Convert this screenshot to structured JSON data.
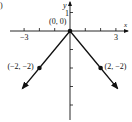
{
  "chart_data": {
    "type": "line",
    "title": "",
    "part_marker": ")",
    "xlabel": "x",
    "ylabel": "y",
    "xlim": [
      -4,
      4
    ],
    "ylim": [
      -5,
      1.5
    ],
    "x_ticks": [
      -3,
      -2,
      -1,
      1,
      2,
      3
    ],
    "x_tick_labels": [
      {
        "value": -3,
        "label": "-3"
      },
      {
        "value": 3,
        "label": "3"
      }
    ],
    "y_ticks": [
      1,
      -1,
      -2,
      -3,
      -4
    ],
    "y_tick_labels": [
      {
        "value": 1,
        "label": "1"
      }
    ],
    "grid": false,
    "series": [
      {
        "name": "left-ray",
        "x": [
          0,
          -2,
          -3.1
        ],
        "y": [
          0,
          -2,
          -3.1
        ],
        "arrow_end": true
      },
      {
        "name": "right-ray",
        "x": [
          0,
          2,
          3.1
        ],
        "y": [
          0,
          -2,
          -3.1
        ],
        "arrow_end": true
      }
    ],
    "points": [
      {
        "x": 0,
        "y": 0,
        "label": "(0, 0)"
      },
      {
        "x": -2,
        "y": -2,
        "label": "(−2, −2)"
      },
      {
        "x": 2,
        "y": -2,
        "label": "(2, −2)"
      }
    ]
  }
}
